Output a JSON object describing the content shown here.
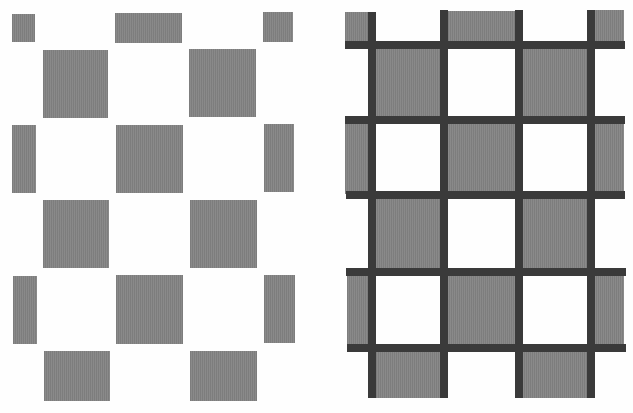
{
  "figure": {
    "colors": {
      "background": "#fefefe",
      "gray_square": "#858585",
      "dark_grid": "#3a3a3a"
    },
    "left_panel": {
      "squares": [
        [
          12,
          14,
          23,
          28
        ],
        [
          115,
          13,
          67,
          30
        ],
        [
          263,
          12,
          30,
          30
        ],
        [
          43,
          50,
          65,
          68
        ],
        [
          189,
          49,
          67,
          68
        ],
        [
          12,
          125,
          24,
          68
        ],
        [
          116,
          125,
          67,
          68
        ],
        [
          264,
          124,
          30,
          68
        ],
        [
          43,
          200,
          66,
          68
        ],
        [
          190,
          200,
          67,
          68
        ],
        [
          13,
          276,
          24,
          68
        ],
        [
          116,
          275,
          67,
          69
        ],
        [
          264,
          275,
          31,
          68
        ],
        [
          44,
          351,
          66,
          50
        ],
        [
          190,
          351,
          67,
          50
        ]
      ]
    },
    "right_panel": {
      "squares": [
        [
          345,
          12,
          30,
          30
        ],
        [
          440,
          11,
          77,
          31
        ],
        [
          588,
          10,
          36,
          32
        ],
        [
          373,
          44,
          68,
          72
        ],
        [
          520,
          44,
          70,
          72
        ],
        [
          345,
          118,
          30,
          76
        ],
        [
          447,
          120,
          72,
          76
        ],
        [
          594,
          118,
          30,
          76
        ],
        [
          373,
          195,
          72,
          76
        ],
        [
          520,
          195,
          70,
          76
        ],
        [
          347,
          272,
          28,
          76
        ],
        [
          447,
          272,
          72,
          76
        ],
        [
          594,
          272,
          30,
          76
        ],
        [
          372,
          348,
          72,
          50
        ],
        [
          520,
          348,
          72,
          50
        ]
      ],
      "hbars": [
        [
          345,
          41,
          280,
          8
        ],
        [
          345,
          116,
          280,
          8
        ],
        [
          346,
          191,
          279,
          8
        ],
        [
          346,
          268,
          280,
          8
        ],
        [
          347,
          344,
          279,
          8
        ]
      ],
      "vbars": [
        [
          368,
          12,
          8,
          386
        ],
        [
          440,
          10,
          8,
          388
        ],
        [
          515,
          10,
          8,
          388
        ],
        [
          587,
          10,
          8,
          388
        ]
      ]
    }
  }
}
